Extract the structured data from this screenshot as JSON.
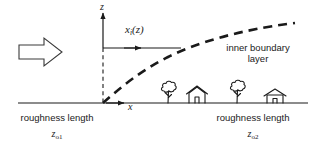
{
  "figure": {
    "type": "schematic-diagram",
    "width": 322,
    "height": 148,
    "background_color": "#ffffff",
    "line_color": "#1a1a1a"
  },
  "axes": {
    "z_label": "z",
    "x_label": "x",
    "origin": {
      "x": 103,
      "y": 103
    },
    "z_axis": {
      "solid_from_y": 48,
      "solid_to_y": 10,
      "dashed_from_y": 48,
      "dashed_to_y": 103,
      "has_arrowhead": true
    },
    "x_axis": {
      "ground_line_x_start": 18,
      "ground_line_x_end": 308,
      "ground_line_y": 103,
      "has_arrowhead": true,
      "arrowhead_x": 126
    }
  },
  "flow_arrow": {
    "name": "incoming-flow-arrow",
    "direction": "right",
    "style": "hollow-block-outline",
    "x": 18,
    "y": 38,
    "width": 44,
    "height": 28
  },
  "height_indicator": {
    "formula": "x",
    "formula_subscript": "i",
    "formula_tail": "(z)",
    "arrow_y": 48,
    "arrow_x_start": 103,
    "arrow_head_x": 143,
    "line_end_x": 181
  },
  "ibl_curve": {
    "label_line_1": "inner boundary",
    "label_line_2": "layer",
    "style": "bold-dashed",
    "points": [
      [
        103,
        103
      ],
      [
        115,
        92
      ],
      [
        128,
        80
      ],
      [
        143,
        69
      ],
      [
        160,
        58
      ],
      [
        180,
        49
      ],
      [
        202,
        41
      ],
      [
        226,
        34
      ],
      [
        250,
        29
      ],
      [
        272,
        25
      ],
      [
        295,
        23
      ]
    ]
  },
  "roughness_left": {
    "label": "roughness length",
    "symbol": "z",
    "symbol_subscript": "o1"
  },
  "roughness_right": {
    "label": "roughness length",
    "symbol": "z",
    "symbol_subscript": "o2"
  },
  "ground_objects": [
    {
      "name": "tree",
      "x": 168,
      "base_y": 103
    },
    {
      "name": "house",
      "x": 196,
      "base_y": 103
    },
    {
      "name": "tree",
      "x": 238,
      "base_y": 103
    },
    {
      "name": "house",
      "x": 275,
      "base_y": 103
    }
  ]
}
